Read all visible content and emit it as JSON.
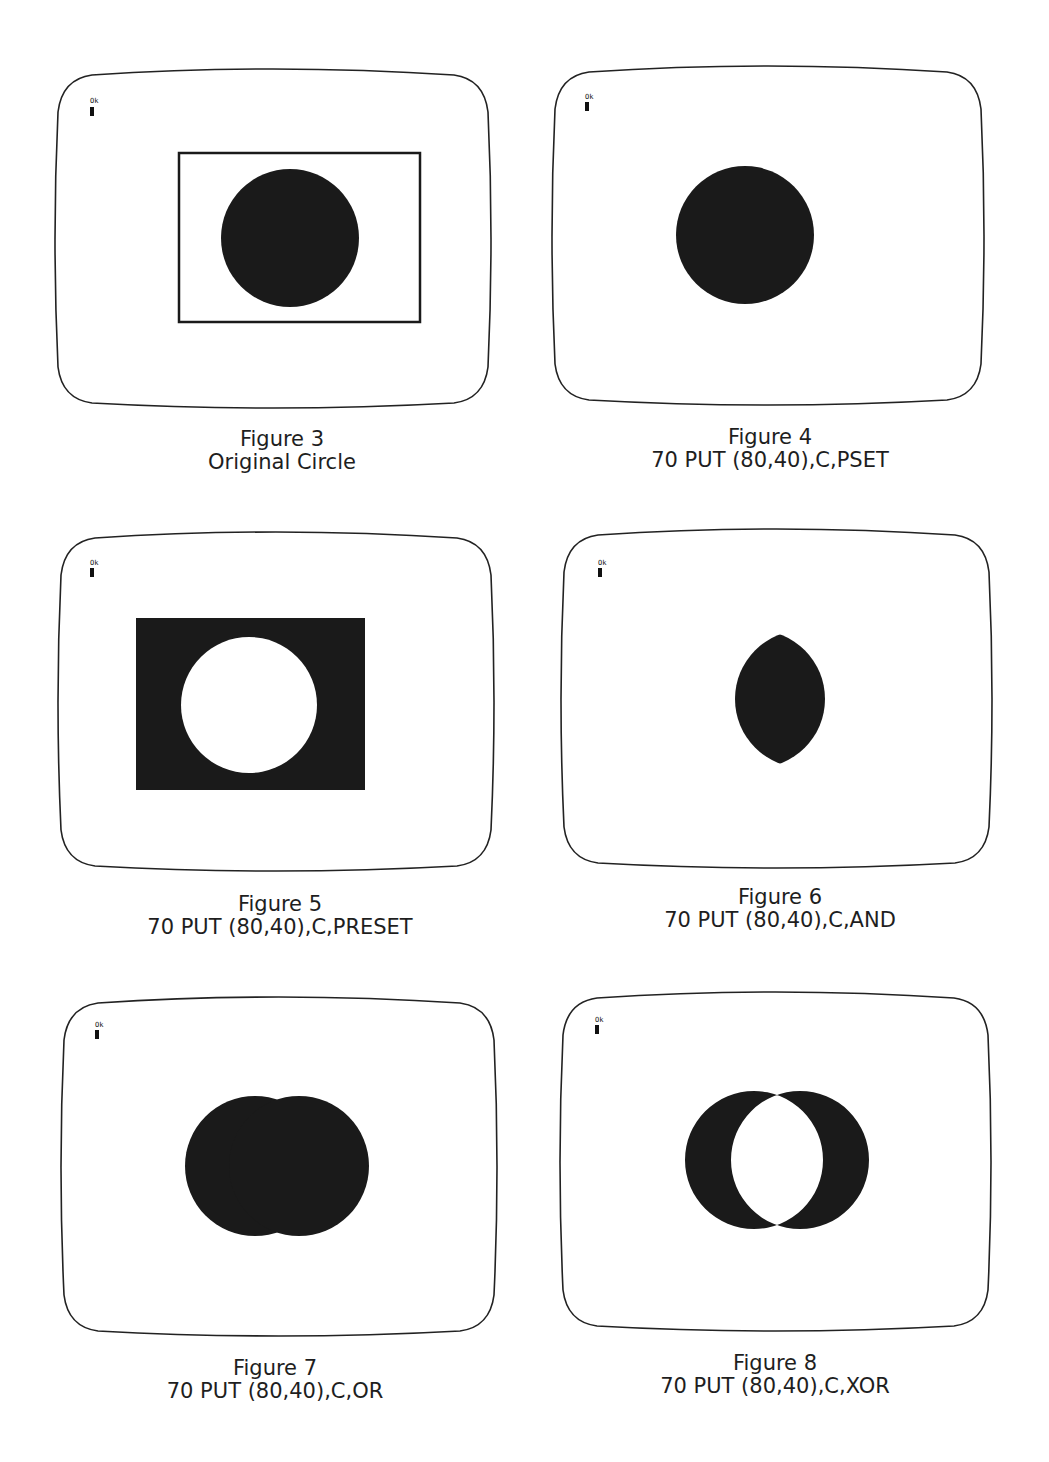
{
  "page": {
    "figures": [
      {
        "number_label": "Figure 3",
        "subtitle": "Original Circle",
        "prompt": "Ok",
        "mode": "original"
      },
      {
        "number_label": "Figure 4",
        "subtitle": "70 PUT (80,40),C,PSET",
        "prompt": "Ok",
        "mode": "PSET"
      },
      {
        "number_label": "Figure 5",
        "subtitle": "70 PUT (80,40),C,PRESET",
        "prompt": "Ok",
        "mode": "PRESET"
      },
      {
        "number_label": "Figure 6",
        "subtitle": "70 PUT (80,40),C,AND",
        "prompt": "Ok",
        "mode": "AND"
      },
      {
        "number_label": "Figure 7",
        "subtitle": "70 PUT (80,40),C,OR",
        "prompt": "Ok",
        "mode": "OR"
      },
      {
        "number_label": "Figure 8",
        "subtitle": "70 PUT (80,40),C,XOR",
        "prompt": "Ok",
        "mode": "XOR"
      }
    ],
    "colors": {
      "ink": "#1a1a1a",
      "paper": "#ffffff"
    }
  }
}
